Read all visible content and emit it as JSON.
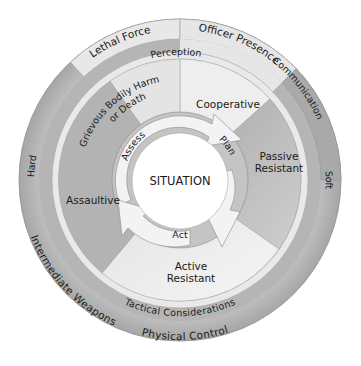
{
  "diagram": {
    "center_label": "SITUATION",
    "cycle": [
      {
        "label": "Assess"
      },
      {
        "label": "Plan"
      },
      {
        "label": "Act"
      }
    ],
    "subject_behaviours": [
      {
        "label": "Cooperative"
      },
      {
        "label_line1": "Passive",
        "label_line2": "Resistant"
      },
      {
        "label_line1": "Active",
        "label_line2": "Resistant"
      },
      {
        "label": "Assaultive"
      },
      {
        "label_line1": "Grievous Bodily Harm",
        "label_line2": "or Death"
      }
    ],
    "inner_ring": {
      "top_label": "Perception",
      "bottom_label": "Tactical Considerations"
    },
    "outer_ring": {
      "lethal_force": "Lethal Force",
      "officer_presence": "Officer Presence",
      "communication": "Communication",
      "soft": "Soft",
      "hard": "Hard",
      "intermediate_weapons": "Intermediate Weapons",
      "physical_control": "Physical Control"
    },
    "colors": {
      "outer_gray": "#b8b8b8",
      "light_band": "#e6e6e6",
      "mid_gray": "#a8a8a8",
      "sector_light": "#efefef",
      "sector_dark": "#b0b0b0",
      "cycle_ring": "#c4c4c4",
      "arrow_fill": "#f4f4f4",
      "center": "#ffffff",
      "stroke": "#7a7a7a"
    }
  }
}
